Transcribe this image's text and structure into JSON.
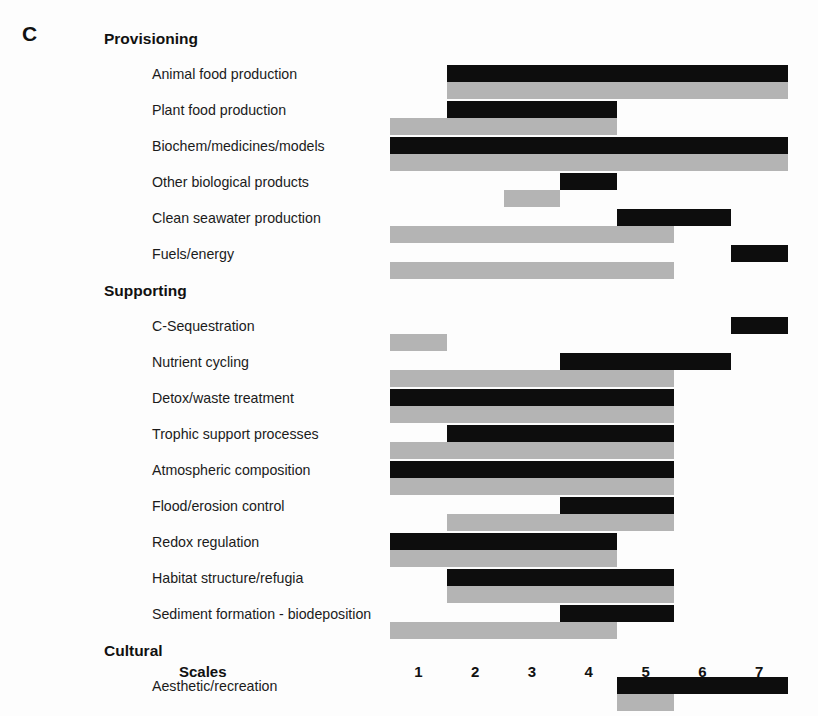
{
  "panel": {
    "letter": "C"
  },
  "axis": {
    "title": "Scales",
    "ticks": [
      "1",
      "2",
      "3",
      "4",
      "5",
      "6",
      "7"
    ],
    "tick_values": [
      1,
      2,
      3,
      4,
      5,
      6,
      7
    ]
  },
  "colors": {
    "primary_bar": "#0d0d0d",
    "secondary_bar": "#b4b4b4",
    "background": "#fdfdfd",
    "text": "#111111"
  },
  "chart_data": {
    "type": "bar",
    "title": "",
    "subtitle": "",
    "xlabel": "Scales",
    "ylabel": "",
    "xlim": [
      0,
      8
    ],
    "grid": false,
    "legend_position": "none",
    "orientation": "horizontal",
    "bar_style": "range-bars",
    "series": [
      {
        "name": "black",
        "color": "#0d0d0d"
      },
      {
        "name": "gray",
        "color": "#b4b4b4"
      }
    ],
    "groups": [
      {
        "label": "Provisioning",
        "items": [
          {
            "label": "Animal food production",
            "black": [
              1.5,
              7.5
            ],
            "gray": [
              1.5,
              7.5
            ]
          },
          {
            "label": "Plant food production",
            "black": [
              1.5,
              4.5
            ],
            "gray": [
              0.5,
              4.5
            ]
          },
          {
            "label": "Biochem/medicines/models",
            "black": [
              0.5,
              7.5
            ],
            "gray": [
              0.5,
              7.5
            ]
          },
          {
            "label": "Other biological products",
            "black": [
              3.5,
              4.5
            ],
            "gray": [
              2.5,
              3.5
            ]
          },
          {
            "label": "Clean seawater production",
            "black": [
              4.5,
              6.5
            ],
            "gray": [
              0.5,
              5.5
            ]
          },
          {
            "label": "Fuels/energy",
            "black": [
              6.5,
              7.5
            ],
            "gray": [
              0.5,
              5.5
            ]
          }
        ]
      },
      {
        "label": "Supporting",
        "items": [
          {
            "label": "C-Sequestration",
            "black": [
              6.5,
              7.5
            ],
            "gray": [
              0.5,
              1.5
            ]
          },
          {
            "label": "Nutrient cycling",
            "black": [
              3.5,
              6.5
            ],
            "gray": [
              0.5,
              5.5
            ]
          },
          {
            "label": "Detox/waste treatment",
            "black": [
              0.5,
              5.5
            ],
            "gray": [
              0.5,
              5.5
            ]
          },
          {
            "label": "Trophic support processes",
            "black": [
              1.5,
              5.5
            ],
            "gray": [
              0.5,
              5.5
            ]
          },
          {
            "label": "Atmospheric composition",
            "black": [
              0.5,
              5.5
            ],
            "gray": [
              0.5,
              5.5
            ]
          },
          {
            "label": "Flood/erosion control",
            "black": [
              3.5,
              5.5
            ],
            "gray": [
              1.5,
              5.5
            ]
          },
          {
            "label": "Redox regulation",
            "black": [
              0.5,
              4.5
            ],
            "gray": [
              0.5,
              4.5
            ]
          },
          {
            "label": "Habitat structure/refugia",
            "black": [
              1.5,
              5.5
            ],
            "gray": [
              1.5,
              5.5
            ]
          },
          {
            "label": "Sediment formation - biodeposition",
            "black": [
              3.5,
              5.5
            ],
            "gray": [
              0.5,
              4.5
            ]
          }
        ]
      },
      {
        "label": "Cultural",
        "items": [
          {
            "label": "Aesthetic/recreation",
            "black": [
              4.5,
              7.5
            ],
            "gray": [
              4.5,
              5.5
            ]
          }
        ]
      }
    ]
  }
}
